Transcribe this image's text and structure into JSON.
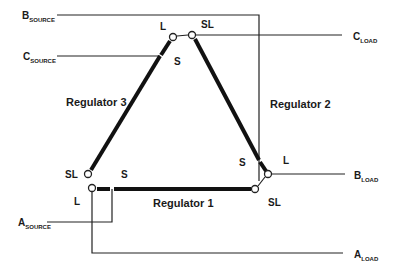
{
  "diagram": {
    "type": "three-regulator delta connection",
    "terminals": {
      "b_source": {
        "main": "B",
        "sub": "SOURCE"
      },
      "c_source": {
        "main": "C",
        "sub": "SOURCE"
      },
      "a_source": {
        "main": "A",
        "sub": "SOURCE"
      },
      "c_load": {
        "main": "C",
        "sub": "LOAD"
      },
      "b_load": {
        "main": "B",
        "sub": "LOAD"
      },
      "a_load": {
        "main": "A",
        "sub": "LOAD"
      }
    },
    "regulators": {
      "r1": "Regulator 1",
      "r2": "Regulator 2",
      "r3": "Regulator 3"
    },
    "pins": {
      "top_l": "L",
      "top_sl": "SL",
      "top_s": "S",
      "bl_sl": "SL",
      "bl_l": "L",
      "bl_s": "S",
      "br_s": "S",
      "br_l": "L",
      "br_sl": "SL"
    },
    "colors": {
      "line": "#222222",
      "background": "#ffffff"
    }
  }
}
